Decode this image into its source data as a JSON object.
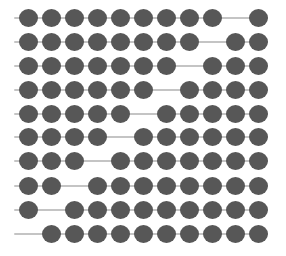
{
  "diagram": {
    "type": "abacus-bead-rows",
    "colors": {
      "bead": "#575757",
      "wire": "#c4c4c4",
      "background": "#ffffff"
    },
    "layout": {
      "row_y": [
        18,
        42,
        66,
        90,
        114,
        137,
        161,
        186,
        210,
        234
      ],
      "wire_x_start": 14,
      "wire_x_end": 268,
      "slot_x": [
        28,
        51,
        74,
        97,
        120,
        143,
        166,
        189,
        212,
        235,
        258
      ],
      "bead_w": 19,
      "bead_h": 18
    },
    "rows": [
      {
        "left_beads": 9,
        "right_beads": 1
      },
      {
        "left_beads": 8,
        "right_beads": 2
      },
      {
        "left_beads": 7,
        "right_beads": 3
      },
      {
        "left_beads": 6,
        "right_beads": 4
      },
      {
        "left_beads": 5,
        "right_beads": 5
      },
      {
        "left_beads": 4,
        "right_beads": 6
      },
      {
        "left_beads": 3,
        "right_beads": 7
      },
      {
        "left_beads": 2,
        "right_beads": 8
      },
      {
        "left_beads": 1,
        "right_beads": 9
      },
      {
        "left_beads": 0,
        "right_beads": 10
      }
    ]
  }
}
